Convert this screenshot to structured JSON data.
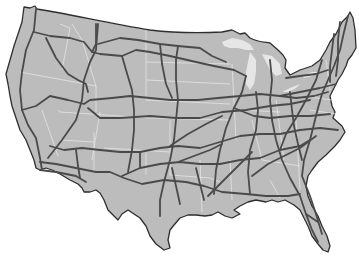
{
  "map": {
    "title": "United States Interstate Highway Map",
    "subject": "Contiguous United States with interstate highways",
    "colors": {
      "land": "#bcbcbc",
      "coastline": "#2e2e2e",
      "highways": "#4a4a4a",
      "state_borders": "#ececec",
      "lakes": "#e6e6e6",
      "background": "#ffffff"
    },
    "features": [
      "coastline",
      "state-borders",
      "interstate-highways",
      "great-lakes"
    ]
  }
}
